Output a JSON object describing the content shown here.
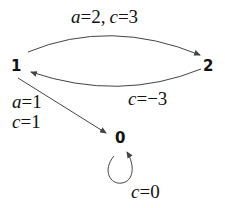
{
  "diagram": {
    "type": "state-transition-graph",
    "nodes": [
      {
        "id": "1",
        "label": "1"
      },
      {
        "id": "2",
        "label": "2"
      },
      {
        "id": "0",
        "label": "0"
      }
    ],
    "edges": [
      {
        "from": "1",
        "to": "2",
        "label": "a=2, c=3",
        "var1": "a",
        "val1": "=2,",
        "var2": "c",
        "val2": "=3"
      },
      {
        "from": "2",
        "to": "1",
        "label": "c=−3",
        "var1": "c",
        "val1": "=−3"
      },
      {
        "from": "1",
        "to": "0",
        "label": "a=1 c=1",
        "var1": "a",
        "val1": "=1",
        "var2": "c",
        "val2": "=1"
      },
      {
        "from": "0",
        "to": "0",
        "label": "c=0",
        "var1": "c",
        "val1": "=0"
      }
    ]
  }
}
